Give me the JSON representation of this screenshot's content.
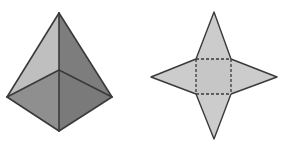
{
  "figure": {
    "title": "",
    "background_color": "#ffffff",
    "width": 282,
    "height": 150,
    "stroke_color": "#3a3a3a",
    "shapes": [
      {
        "name": "square-pyramid-3d",
        "label": "Square pyramid shown in three-dimensional perspective view",
        "vertices": {
          "apex": [
            59,
            13
          ],
          "base_back": [
            59,
            70
          ],
          "base_left": [
            7,
            97
          ],
          "base_right": [
            112,
            97
          ],
          "base_front": [
            59,
            131
          ]
        },
        "faces": [
          {
            "name": "upper-left-face",
            "fill": "#bfbfbf",
            "points": "59,13 7,97 59,70"
          },
          {
            "name": "upper-right-face",
            "fill": "#7d7d7d",
            "points": "59,13 59,70 112,97"
          },
          {
            "name": "lower-left-face",
            "fill": "#8f8f8f",
            "points": "7,97 59,131 59,70"
          },
          {
            "name": "lower-right-face",
            "fill": "#7a7a7a",
            "points": "59,70 59,131 112,97"
          }
        ],
        "edges": [
          {
            "name": "apex-to-left-edge",
            "from": [
              59,
              13
            ],
            "to": [
              7,
              97
            ],
            "style": "solid"
          },
          {
            "name": "apex-to-right-edge",
            "from": [
              59,
              13
            ],
            "to": [
              112,
              97
            ],
            "style": "solid"
          },
          {
            "name": "apex-to-center-edge",
            "from": [
              59,
              13
            ],
            "to": [
              59,
              70
            ],
            "style": "solid"
          },
          {
            "name": "center-to-front-edge",
            "from": [
              59,
              70
            ],
            "to": [
              59,
              131
            ],
            "style": "solid"
          },
          {
            "name": "center-to-left-edge",
            "from": [
              59,
              70
            ],
            "to": [
              7,
              97
            ],
            "style": "solid"
          },
          {
            "name": "center-to-right-edge",
            "from": [
              59,
              70
            ],
            "to": [
              112,
              97
            ],
            "style": "solid"
          },
          {
            "name": "left-to-front-edge",
            "from": [
              7,
              97
            ],
            "to": [
              59,
              131
            ],
            "style": "solid"
          },
          {
            "name": "right-to-front-edge",
            "from": [
              112,
              97
            ],
            "to": [
              59,
              131
            ],
            "style": "solid"
          }
        ]
      },
      {
        "name": "pyramid-net-star",
        "label": "Four-pointed star net of the square pyramid with dashed square base",
        "fill": "#cccccc",
        "outline_points": "214,12 231,59 277,77 231,94 214,139 196,94 151,77 196,59",
        "tips": {
          "top": [
            214,
            12
          ],
          "right": [
            277,
            77
          ],
          "bottom": [
            214,
            139
          ],
          "left": [
            151,
            77
          ]
        },
        "base_square": {
          "name": "dashed-base-square",
          "x": 196,
          "y": 59,
          "width": 35,
          "height": 35,
          "style": "dashed",
          "fill": "#c6c6c6"
        },
        "fold_edges": [
          {
            "name": "fold-edge-top",
            "from": [
              196,
              59
            ],
            "to": [
              231,
              59
            ],
            "style": "dashed"
          },
          {
            "name": "fold-edge-right",
            "from": [
              231,
              59
            ],
            "to": [
              231,
              94
            ],
            "style": "dashed"
          },
          {
            "name": "fold-edge-bottom",
            "from": [
              196,
              94
            ],
            "to": [
              231,
              94
            ],
            "style": "dashed"
          },
          {
            "name": "fold-edge-left",
            "from": [
              196,
              59
            ],
            "to": [
              196,
              94
            ],
            "style": "dashed"
          }
        ]
      }
    ]
  }
}
